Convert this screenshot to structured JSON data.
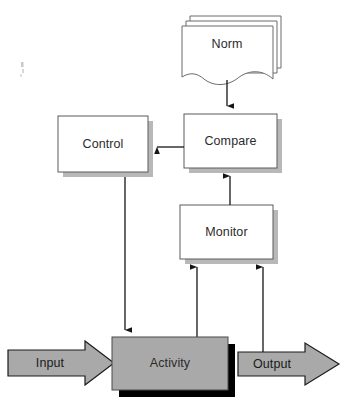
{
  "diagram": {
    "background_color": "#ffffff",
    "nodes": {
      "norm": {
        "label": "Norm",
        "shape": "stacked-document",
        "icon": "document-stack-icon",
        "fill": "#ffffff",
        "stroke": "#6a6a6a"
      },
      "control": {
        "label": "Control",
        "shape": "rectangle-with-shadow",
        "fill": "#ffffff",
        "stroke": "#5a5a5a",
        "shadow": "#b8b8b8"
      },
      "compare": {
        "label": "Compare",
        "shape": "rectangle-with-shadow",
        "fill": "#ffffff",
        "stroke": "#5a5a5a",
        "shadow": "#b8b8b8"
      },
      "monitor": {
        "label": "Monitor",
        "shape": "rectangle-with-shadow",
        "fill": "#ffffff",
        "stroke": "#5a5a5a",
        "shadow": "#b8b8b8"
      },
      "activity": {
        "label": "Activity",
        "shape": "filled-rectangle-with-shadow",
        "fill": "#a9a9a9",
        "stroke": "#4a4a4a",
        "shadow": "#000000"
      },
      "input": {
        "label": "Input",
        "shape": "block-arrow-right",
        "fill": "#a9a9a9",
        "stroke": "#1c1c1c"
      },
      "output": {
        "label": "Output",
        "shape": "block-arrow-right",
        "fill": "#a9a9a9",
        "stroke": "#1c1c1c"
      }
    },
    "edges": [
      {
        "from": "norm",
        "to": "compare",
        "direction": "down",
        "arrowhead": true
      },
      {
        "from": "compare",
        "to": "control",
        "direction": "left",
        "arrowhead": true
      },
      {
        "from": "monitor",
        "to": "compare",
        "direction": "up",
        "arrowhead": true
      },
      {
        "from": "control",
        "to": "activity",
        "direction": "down",
        "arrowhead": true
      },
      {
        "from": "activity",
        "to": "monitor",
        "direction": "up",
        "arrowhead": true
      },
      {
        "from": "output",
        "to": "monitor",
        "direction": "up",
        "arrowhead": true
      },
      {
        "from": "input",
        "to": "activity",
        "direction": "right",
        "arrowhead": true
      }
    ]
  }
}
